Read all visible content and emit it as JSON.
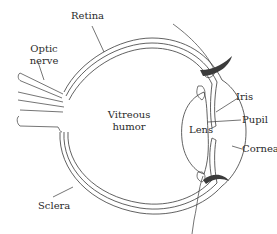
{
  "diagram": {
    "labels": {
      "retina": "Retina",
      "optic_nerve_line1": "Optic",
      "optic_nerve_line2": "nerve",
      "vitreous_line1": "Vitreous",
      "vitreous_line2": "humor",
      "lens": "Lens",
      "iris": "Iris",
      "pupil": "Pupil",
      "cornea": "Cornea",
      "sclera": "Sclera"
    },
    "colors": {
      "line": "#3a3a3a",
      "eyelid": "#3b3b3b",
      "text": "#2a2a2a",
      "background": "#ffffff"
    }
  }
}
